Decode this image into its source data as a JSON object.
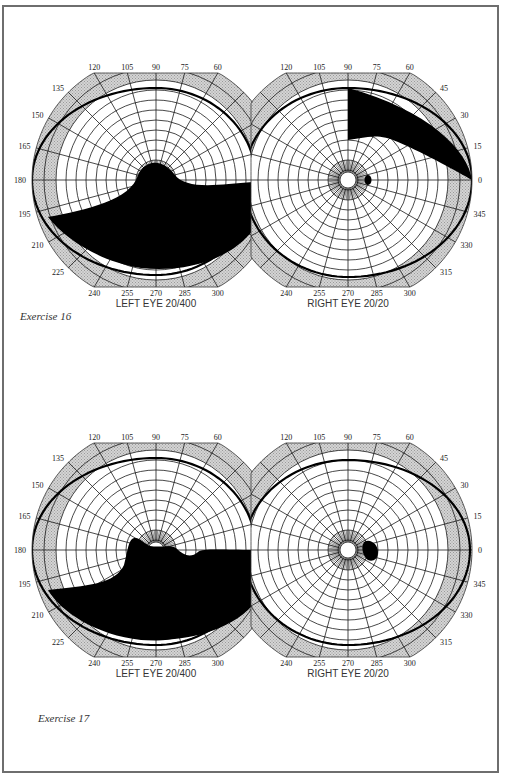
{
  "page": {
    "exercises": [
      {
        "caption": "Exercise 16",
        "fields": [
          {
            "eye": "left",
            "label": "LEFT EYE",
            "acuity": "20/400",
            "isopter_boundary_deg": {
              "0": 0.98,
              "30": 0.9,
              "45": 0.88,
              "60": 0.86,
              "75": 0.84,
              "90": 0.83,
              "105": 0.85,
              "120": 0.88,
              "135": 0.92,
              "150": 0.97,
              "165": 1.0,
              "180": 1.0,
              "195": 0.97,
              "210": 0.92,
              "225": 0.86,
              "240": 0.81,
              "255": 0.79,
              "270": 0.78,
              "285": 0.79,
              "300": 0.81,
              "315": 0.85,
              "330": 0.9,
              "345": 0.95
            },
            "defect": "inferior field loss with central bulge to fixation",
            "defect_color": "#000000"
          },
          {
            "eye": "right",
            "label": "RIGHT EYE",
            "acuity": "20/20",
            "defect": "superior temporal quadrant sector loss; blind spot",
            "defect_color": "#000000"
          }
        ]
      },
      {
        "caption": "Exercise 17",
        "fields": [
          {
            "eye": "left",
            "label": "LEFT EYE",
            "acuity": "20/400",
            "defect": "inferior altitudinal field loss",
            "defect_color": "#000000"
          },
          {
            "eye": "right",
            "label": "RIGHT EYE",
            "acuity": "20/20",
            "defect": "enlarged blind spot",
            "defect_color": "#000000"
          }
        ]
      }
    ],
    "left_ticks": [
      "120",
      "105",
      "90",
      "75",
      "60",
      "135",
      "150",
      "165",
      "180",
      "195",
      "210",
      "225",
      "240",
      "255",
      "270",
      "285",
      "300"
    ],
    "right_ticks": [
      "120",
      "105",
      "90",
      "75",
      "60",
      "45",
      "30",
      "15",
      "0",
      "345",
      "330",
      "315",
      "240",
      "255",
      "270",
      "285",
      "300"
    ],
    "colors": {
      "hatch": "#c8c8c8",
      "grid": "#1a1a1a",
      "frame": "#6e6e6e",
      "fill": "#000000"
    }
  },
  "chart_data": [
    {
      "type": "polar",
      "title": "Exercise 16 — Left Eye Visual Field",
      "eye": "LEFT EYE",
      "acuity": "20/400",
      "angular_ticks_deg": [
        0,
        15,
        30,
        45,
        60,
        75,
        90,
        105,
        120,
        135,
        150,
        165,
        180,
        195,
        210,
        225,
        240,
        255,
        270,
        285,
        300,
        315,
        330,
        345
      ],
      "shaded_region": "inferior hemifield defect rising to fixation near 255-285 deg axis"
    },
    {
      "type": "polar",
      "title": "Exercise 16 — Right Eye Visual Field",
      "eye": "RIGHT EYE",
      "acuity": "20/20",
      "angular_ticks_deg": [
        0,
        15,
        30,
        45,
        60,
        75,
        90,
        105,
        120,
        135,
        150,
        165,
        180,
        195,
        210,
        225,
        240,
        255,
        270,
        285,
        300,
        315,
        330,
        345
      ],
      "shaded_region": "superior temporal sector defect from 0 to 90 deg (peripheral); blind spot at ~15 deg temporal"
    },
    {
      "type": "polar",
      "title": "Exercise 17 — Left Eye Visual Field",
      "eye": "LEFT EYE",
      "acuity": "20/400",
      "angular_ticks_deg": [
        0,
        15,
        30,
        45,
        60,
        75,
        90,
        105,
        120,
        135,
        150,
        165,
        180,
        195,
        210,
        225,
        240,
        255,
        270,
        285,
        300,
        315,
        330,
        345
      ],
      "shaded_region": "inferior altitudinal defect, horizontal upper edge near 180-0 meridian"
    },
    {
      "type": "polar",
      "title": "Exercise 17 — Right Eye Visual Field",
      "eye": "RIGHT EYE",
      "acuity": "20/20",
      "angular_ticks_deg": [
        0,
        15,
        30,
        45,
        60,
        75,
        90,
        105,
        120,
        135,
        150,
        165,
        180,
        195,
        210,
        225,
        240,
        255,
        270,
        285,
        300,
        315,
        330,
        345
      ],
      "shaded_region": "enlarged blind spot temporal to fixation"
    }
  ]
}
